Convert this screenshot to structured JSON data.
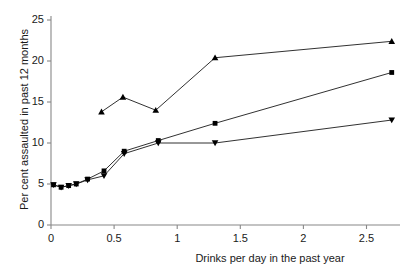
{
  "chart_data": {
    "type": "line",
    "title": "",
    "xlabel": "Drinks per day in the past year",
    "ylabel": "Per cent assaulted in past 12 months",
    "xlim": [
      0,
      2.78
    ],
    "ylim": [
      0,
      25
    ],
    "xticks": [
      0,
      0.5,
      1,
      1.5,
      2,
      2.5
    ],
    "xticklabels": [
      "0",
      "0.5",
      "1",
      "1.5",
      "2",
      "2.5"
    ],
    "yticks": [
      0,
      5,
      10,
      15,
      20,
      25
    ],
    "yticklabels": [
      "0",
      "5",
      "10",
      "15",
      "20",
      "25"
    ],
    "grid": false,
    "legend": "none",
    "axis_color": "#888888",
    "line_color": "#1a1a1a",
    "marker_color": "#000000",
    "series": [
      {
        "name": "squares",
        "marker": "square",
        "x": [
          0.02,
          0.08,
          0.14,
          0.2,
          0.29,
          0.42,
          0.58,
          0.85,
          1.3,
          2.7
        ],
        "y": [
          4.9,
          4.6,
          4.8,
          5.0,
          5.6,
          6.6,
          9.0,
          10.3,
          12.4,
          18.6
        ]
      },
      {
        "name": "down-triangles",
        "marker": "triangle-down",
        "x": [
          0.02,
          0.08,
          0.14,
          0.2,
          0.29,
          0.42,
          0.58,
          0.85,
          1.3,
          2.7
        ],
        "y": [
          4.9,
          4.6,
          4.8,
          5.0,
          5.5,
          6.0,
          8.7,
          10.0,
          10.0,
          12.8
        ]
      },
      {
        "name": "up-triangles",
        "marker": "triangle-up",
        "x": [
          0.4,
          0.57,
          0.83,
          1.3,
          2.7
        ],
        "y": [
          13.8,
          15.6,
          14.0,
          20.4,
          22.4
        ]
      }
    ]
  }
}
